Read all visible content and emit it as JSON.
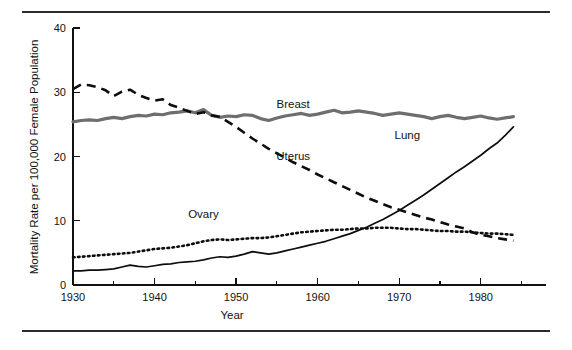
{
  "figure": {
    "top_rule": "",
    "bottom_rule": ""
  },
  "chart_data": {
    "type": "line",
    "title": "",
    "xlabel": "Year",
    "ylabel": "Mortality Rate per 100,000 Female Population",
    "xlim": [
      1930,
      1988
    ],
    "ylim": [
      0,
      40
    ],
    "xticks": [
      1930,
      1940,
      1950,
      1960,
      1970,
      1980
    ],
    "xtick_labels": [
      "1930",
      "1940",
      "1950",
      "1960",
      "1970",
      "1980"
    ],
    "xminor_ticks": [
      1935,
      1945,
      1955,
      1965,
      1975,
      1985
    ],
    "yticks": [
      0,
      10,
      20,
      30,
      40
    ],
    "ytick_labels": [
      "0",
      "10",
      "20",
      "30",
      "40"
    ],
    "grid": false,
    "legend_position": "inline-annotations",
    "x": [
      1930,
      1931,
      1932,
      1933,
      1934,
      1935,
      1936,
      1937,
      1938,
      1939,
      1940,
      1941,
      1942,
      1943,
      1944,
      1945,
      1946,
      1947,
      1948,
      1949,
      1950,
      1951,
      1952,
      1953,
      1954,
      1955,
      1956,
      1957,
      1958,
      1959,
      1960,
      1961,
      1962,
      1963,
      1964,
      1965,
      1966,
      1967,
      1968,
      1969,
      1970,
      1971,
      1972,
      1973,
      1974,
      1975,
      1976,
      1977,
      1978,
      1979,
      1980,
      1981,
      1982,
      1983,
      1984
    ],
    "series": [
      {
        "name": "Breast",
        "style": "solid-thick-gray",
        "color": "#6e6e6e",
        "label_x": 1957,
        "label_y": 27.6,
        "values": [
          25.4,
          25.6,
          25.7,
          25.6,
          25.9,
          26.1,
          25.9,
          26.2,
          26.4,
          26.3,
          26.6,
          26.5,
          26.8,
          26.9,
          27.1,
          26.8,
          27.3,
          26.4,
          26.1,
          26.3,
          26.2,
          26.5,
          26.4,
          25.9,
          25.6,
          26.0,
          26.3,
          26.5,
          26.7,
          26.4,
          26.6,
          26.9,
          27.2,
          26.8,
          26.9,
          27.1,
          26.9,
          26.7,
          26.4,
          26.6,
          26.8,
          26.6,
          26.4,
          26.2,
          25.9,
          26.2,
          26.4,
          26.1,
          25.9,
          26.1,
          26.3,
          26.0,
          25.8,
          26.0,
          26.2
        ]
      },
      {
        "name": "Uterus",
        "style": "dashed-black",
        "color": "#0d0d0d",
        "label_x": 1957,
        "label_y": 19.5,
        "values": [
          30.5,
          31.2,
          31.1,
          30.8,
          30.3,
          29.4,
          30.1,
          30.4,
          29.6,
          29.1,
          28.7,
          28.9,
          28.0,
          27.6,
          27.1,
          26.6,
          26.9,
          26.4,
          26.2,
          25.4,
          24.6,
          23.7,
          22.8,
          22.0,
          21.2,
          20.5,
          19.8,
          19.1,
          18.5,
          17.9,
          17.2,
          16.6,
          16.0,
          15.4,
          14.8,
          14.2,
          13.6,
          13.1,
          12.6,
          12.1,
          11.7,
          11.3,
          10.9,
          10.5,
          10.2,
          9.8,
          9.4,
          9.1,
          8.8,
          8.2,
          7.8,
          7.6,
          7.3,
          7.1,
          6.9
        ]
      },
      {
        "name": "Ovary",
        "style": "dotted-black",
        "color": "#0d0d0d",
        "label_x": 1946,
        "label_y": 10.4,
        "values": [
          4.3,
          4.4,
          4.5,
          4.6,
          4.7,
          4.8,
          4.9,
          5.0,
          5.2,
          5.4,
          5.6,
          5.7,
          5.8,
          6.0,
          6.2,
          6.5,
          6.8,
          7.0,
          7.1,
          7.0,
          7.1,
          7.2,
          7.3,
          7.3,
          7.4,
          7.6,
          7.8,
          8.0,
          8.2,
          8.3,
          8.4,
          8.5,
          8.6,
          8.6,
          8.7,
          8.8,
          8.8,
          8.9,
          8.9,
          8.9,
          8.8,
          8.7,
          8.7,
          8.6,
          8.5,
          8.4,
          8.4,
          8.3,
          8.3,
          8.2,
          8.1,
          8.0,
          8.0,
          7.9,
          7.8
        ]
      },
      {
        "name": "Lung",
        "style": "solid-thin-black",
        "color": "#0d0d0d",
        "label_x": 1971,
        "label_y": 22.8,
        "values": [
          2.2,
          2.2,
          2.3,
          2.3,
          2.4,
          2.5,
          2.8,
          3.1,
          2.9,
          2.8,
          3.0,
          3.2,
          3.3,
          3.5,
          3.6,
          3.7,
          3.9,
          4.2,
          4.4,
          4.3,
          4.5,
          4.8,
          5.2,
          5.0,
          4.8,
          5.0,
          5.3,
          5.6,
          5.9,
          6.2,
          6.5,
          6.8,
          7.2,
          7.6,
          8.0,
          8.5,
          9.0,
          9.6,
          10.2,
          10.9,
          11.6,
          12.4,
          13.2,
          14.0,
          14.9,
          15.8,
          16.7,
          17.6,
          18.4,
          19.3,
          20.2,
          21.2,
          22.1,
          23.3,
          24.6
        ]
      }
    ]
  }
}
